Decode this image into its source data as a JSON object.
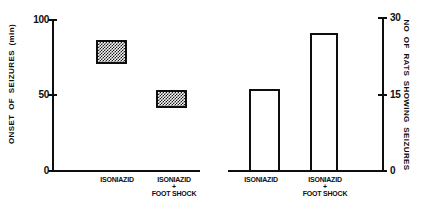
{
  "labels": {
    "isoniazid": "ISONIAZID",
    "plus": "+",
    "foot_shock": "FOOT SHOCK"
  },
  "colors": {
    "ink": "#0e0e0e",
    "paper": "#ffffff"
  },
  "chart_data": [
    {
      "type": "bar",
      "subtype": "floating-range-box",
      "title": "",
      "xlabel": "",
      "ylabel": "ONSET OF SEIZURES (min)",
      "categories": [
        "ISONIAZID",
        "ISONIAZID + FOOT SHOCK"
      ],
      "series": [
        {
          "name": "onset of seizures range (min)",
          "ranges": [
            [
              71,
              87
            ],
            [
              42,
              54
            ]
          ]
        }
      ],
      "ylim": [
        0,
        100
      ],
      "yticks": [
        0,
        50,
        100
      ],
      "yaxis_side": "left",
      "grid": false,
      "legend": "none",
      "bar_fill": "crosshatch"
    },
    {
      "type": "bar",
      "title": "",
      "xlabel": "",
      "ylabel": "NO OF RATS SHOWING SEIZURES",
      "categories": [
        "ISONIAZID",
        "ISONIAZID + FOOT SHOCK"
      ],
      "values": [
        16,
        27
      ],
      "ylim": [
        0,
        30
      ],
      "yticks": [
        0,
        15,
        30
      ],
      "yaxis_side": "right",
      "grid": false,
      "legend": "none",
      "bar_fill": "open"
    }
  ]
}
